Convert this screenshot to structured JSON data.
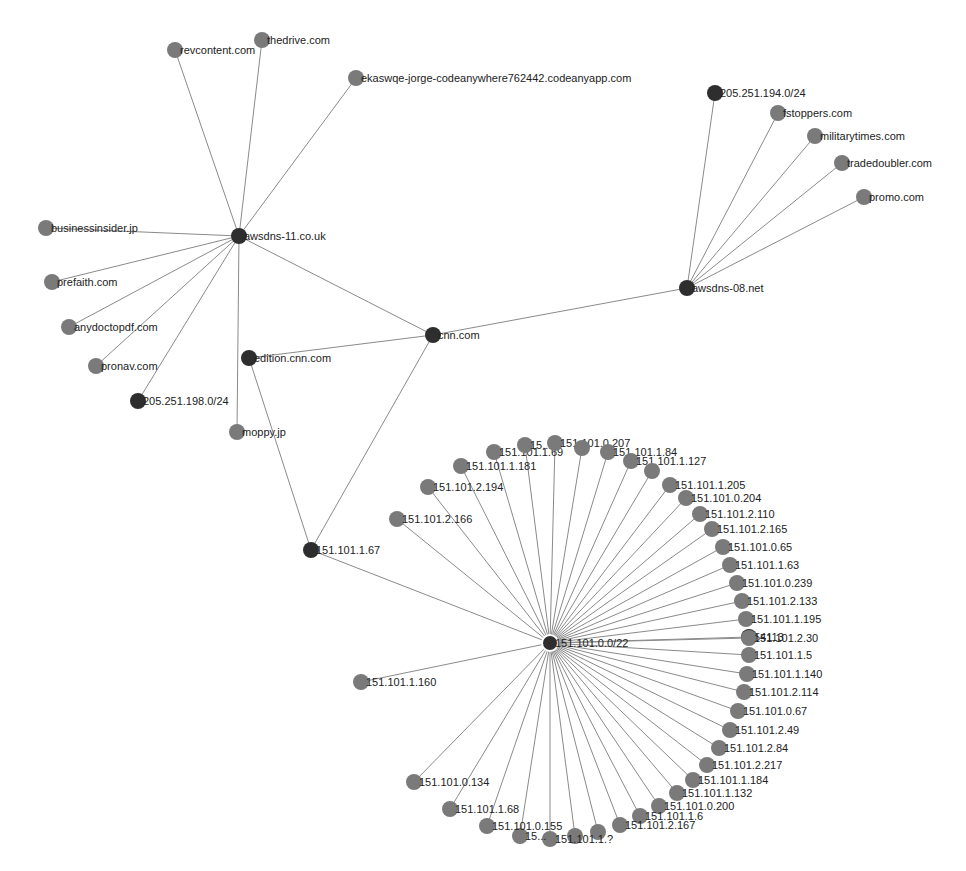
{
  "colors": {
    "background": "#ffffff",
    "edge": "#8a8a8a",
    "hub_node": "#2e2e2e",
    "leaf_node": "#7a7a7a",
    "selected_ring": "#ffffff",
    "label": "#222222"
  },
  "graph": {
    "node_radius": 8,
    "nodes": [
      {
        "id": "cnn.com",
        "x": 433,
        "y": 335,
        "type": "hub"
      },
      {
        "id": "awsdns-11.co.uk",
        "x": 239,
        "y": 236,
        "type": "hub"
      },
      {
        "id": "awsdns-08.net",
        "x": 687,
        "y": 288,
        "type": "hub"
      },
      {
        "id": "edition.cnn.com",
        "x": 249,
        "y": 358,
        "type": "hub"
      },
      {
        "id": "151.101.1.67",
        "x": 311,
        "y": 550,
        "type": "hub"
      },
      {
        "id": "151.101.0.0/22",
        "x": 550,
        "y": 643,
        "type": "hub",
        "selected": true
      },
      {
        "id": "205.251.198.0/24",
        "x": 138,
        "y": 401,
        "type": "hub"
      },
      {
        "id": "205.251.194.0/24",
        "x": 715,
        "y": 93,
        "type": "hub"
      },
      {
        "id": "54113",
        "x": 749,
        "y": 637,
        "type": "hub"
      },
      {
        "id": "revcontent.com",
        "x": 175,
        "y": 50,
        "type": "leaf"
      },
      {
        "id": "thedrive.com",
        "x": 262,
        "y": 40,
        "type": "leaf"
      },
      {
        "id": "ekaswqe-jorge-codeanywhere762442.codeanyapp.com",
        "x": 356,
        "y": 78,
        "type": "leaf"
      },
      {
        "id": "businessinsider.jp",
        "x": 46,
        "y": 228,
        "type": "leaf"
      },
      {
        "id": "prefaith.com",
        "x": 52,
        "y": 282,
        "type": "leaf"
      },
      {
        "id": "anydoctopdf.com",
        "x": 69,
        "y": 327,
        "type": "leaf"
      },
      {
        "id": "pronav.com",
        "x": 96,
        "y": 366,
        "type": "leaf"
      },
      {
        "id": "moppy.jp",
        "x": 237,
        "y": 432,
        "type": "leaf"
      },
      {
        "id": "fstoppers.com",
        "x": 778,
        "y": 113,
        "type": "leaf"
      },
      {
        "id": "militarytimes.com",
        "x": 815,
        "y": 136,
        "type": "leaf"
      },
      {
        "id": "tradedoubler.com",
        "x": 842,
        "y": 163,
        "type": "leaf"
      },
      {
        "id": "promo.com",
        "x": 864,
        "y": 197,
        "type": "leaf"
      },
      {
        "id": "151.101.1.160",
        "x": 361,
        "y": 682,
        "type": "leaf"
      },
      {
        "id": "151.101.2.166",
        "x": 397,
        "y": 519,
        "type": "leaf"
      },
      {
        "id": "151.101.2.194",
        "x": 428,
        "y": 487,
        "type": "leaf"
      },
      {
        "id": "151.101.1.181",
        "x": 461,
        "y": 466,
        "type": "leaf"
      },
      {
        "id": "151.101.1.69",
        "x": 494,
        "y": 452,
        "type": "leaf"
      },
      {
        "id": "151.101.?.?",
        "x": 525,
        "y": 445,
        "type": "leaf",
        "label": "15..."
      },
      {
        "id": "151.101.0.207",
        "x": 555,
        "y": 443,
        "type": "leaf"
      },
      {
        "id": "151.101.?.84",
        "x": 582,
        "y": 448,
        "type": "leaf",
        "label": ""
      },
      {
        "id": "151.101.1.84",
        "x": 608,
        "y": 452,
        "type": "leaf"
      },
      {
        "id": "151.101.1.127",
        "x": 631,
        "y": 461,
        "type": "leaf"
      },
      {
        "id": "151.101.2.174",
        "x": 652,
        "y": 471,
        "type": "leaf",
        "label": ""
      },
      {
        "id": "151.101.1.205",
        "x": 670,
        "y": 485,
        "type": "leaf"
      },
      {
        "id": "151.101.0.204",
        "x": 686,
        "y": 498,
        "type": "leaf"
      },
      {
        "id": "151.101.2.110",
        "x": 700,
        "y": 514,
        "type": "leaf"
      },
      {
        "id": "151.101.2.165",
        "x": 712,
        "y": 529,
        "type": "leaf"
      },
      {
        "id": "151.101.0.65",
        "x": 723,
        "y": 547,
        "type": "leaf"
      },
      {
        "id": "151.101.1.63",
        "x": 730,
        "y": 565,
        "type": "leaf"
      },
      {
        "id": "151.101.0.239",
        "x": 737,
        "y": 583,
        "type": "leaf"
      },
      {
        "id": "151.101.2.133",
        "x": 742,
        "y": 601,
        "type": "leaf"
      },
      {
        "id": "151.101.1.195",
        "x": 746,
        "y": 619,
        "type": "leaf"
      },
      {
        "id": "151.101.2.30",
        "x": 749,
        "y": 638,
        "type": "leaf",
        "skip_label_pos": true
      },
      {
        "id": "151.101.1.5",
        "x": 749,
        "y": 655,
        "type": "leaf"
      },
      {
        "id": "151.101.1.140",
        "x": 747,
        "y": 674,
        "type": "leaf"
      },
      {
        "id": "151.101.2.114",
        "x": 744,
        "y": 692,
        "type": "leaf"
      },
      {
        "id": "151.101.0.67",
        "x": 738,
        "y": 711,
        "type": "leaf"
      },
      {
        "id": "151.101.2.49",
        "x": 730,
        "y": 730,
        "type": "leaf"
      },
      {
        "id": "151.101.2.84",
        "x": 719,
        "y": 748,
        "type": "leaf"
      },
      {
        "id": "151.101.2.217",
        "x": 707,
        "y": 765,
        "type": "leaf"
      },
      {
        "id": "151.101.1.184",
        "x": 693,
        "y": 780,
        "type": "leaf"
      },
      {
        "id": "151.101.1.132",
        "x": 677,
        "y": 793,
        "type": "leaf"
      },
      {
        "id": "151.101.0.200",
        "x": 659,
        "y": 806,
        "type": "leaf"
      },
      {
        "id": "151.101.1.6",
        "x": 640,
        "y": 816,
        "type": "leaf"
      },
      {
        "id": "151.101.2.167",
        "x": 620,
        "y": 825,
        "type": "leaf"
      },
      {
        "id": "151.101.2.207",
        "x": 598,
        "y": 832,
        "type": "leaf",
        "label": ""
      },
      {
        "id": "151.101.2.152",
        "x": 575,
        "y": 836,
        "type": "leaf",
        "label": ""
      },
      {
        "id": "151.101.1.?",
        "x": 550,
        "y": 839,
        "type": "leaf",
        "label": "151.101.1.?"
      },
      {
        "id": "151.101.?.??",
        "x": 520,
        "y": 836,
        "type": "leaf",
        "label": "15..."
      },
      {
        "id": "151.101.0.155",
        "x": 487,
        "y": 826,
        "type": "leaf"
      },
      {
        "id": "151.101.1.68",
        "x": 450,
        "y": 809,
        "type": "leaf"
      },
      {
        "id": "151.101.0.134",
        "x": 414,
        "y": 782,
        "type": "leaf"
      }
    ],
    "edges": [
      [
        "cnn.com",
        "awsdns-11.co.uk"
      ],
      [
        "cnn.com",
        "awsdns-08.net"
      ],
      [
        "cnn.com",
        "edition.cnn.com"
      ],
      [
        "cnn.com",
        "151.101.1.67"
      ],
      [
        "edition.cnn.com",
        "151.101.1.67"
      ],
      [
        "151.101.1.67",
        "151.101.0.0/22"
      ],
      [
        "awsdns-11.co.uk",
        "revcontent.com"
      ],
      [
        "awsdns-11.co.uk",
        "thedrive.com"
      ],
      [
        "awsdns-11.co.uk",
        "ekaswqe-jorge-codeanywhere762442.codeanyapp.com"
      ],
      [
        "awsdns-11.co.uk",
        "businessinsider.jp"
      ],
      [
        "awsdns-11.co.uk",
        "prefaith.com"
      ],
      [
        "awsdns-11.co.uk",
        "anydoctopdf.com"
      ],
      [
        "awsdns-11.co.uk",
        "pronav.com"
      ],
      [
        "awsdns-11.co.uk",
        "205.251.198.0/24"
      ],
      [
        "awsdns-11.co.uk",
        "moppy.jp"
      ],
      [
        "awsdns-08.net",
        "205.251.194.0/24"
      ],
      [
        "awsdns-08.net",
        "fstoppers.com"
      ],
      [
        "awsdns-08.net",
        "militarytimes.com"
      ],
      [
        "awsdns-08.net",
        "tradedoubler.com"
      ],
      [
        "awsdns-08.net",
        "promo.com"
      ]
    ],
    "star_center": "151.101.0.0/22",
    "star_exclude": [
      "cnn.com",
      "awsdns-11.co.uk",
      "awsdns-08.net",
      "edition.cnn.com",
      "151.101.1.67",
      "151.101.0.0/22",
      "205.251.198.0/24",
      "205.251.194.0/24",
      "revcontent.com",
      "thedrive.com",
      "ekaswqe-jorge-codeanywhere762442.codeanyapp.com",
      "businessinsider.jp",
      "prefaith.com",
      "anydoctopdf.com",
      "pronav.com",
      "moppy.jp",
      "fstoppers.com",
      "militarytimes.com",
      "tradedoubler.com",
      "promo.com"
    ]
  }
}
